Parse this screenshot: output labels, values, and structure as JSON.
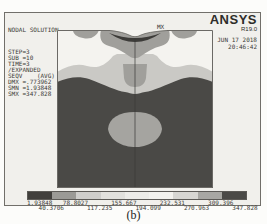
{
  "figure": {
    "brand": {
      "name": "ANSYS",
      "version": "R19.0"
    },
    "timestamp": {
      "date": "JUN 17 2018",
      "time": "20:46:42"
    },
    "solution_info": {
      "title": "NODAL SOLUTION",
      "lines": [
        "STEP=3",
        "SUB =10",
        "TIME=3",
        "/EXPANDED",
        "SEQV    (AVG)",
        "DMX =.773962",
        "SMN =1.93848",
        "SMX =347.828"
      ]
    },
    "plot": {
      "max_label": "MX",
      "colors": {
        "background": "#f4f3ef",
        "light": "#cac9c5",
        "medium": "#a09f9b",
        "tongue": "#a09f9b",
        "dark": "#4a4946",
        "crescent": "#3d3c39",
        "blob": "#a5a4a0",
        "centerline": "#3a3936",
        "border": "#6b6965"
      }
    },
    "colorbar": {
      "values": [
        "1.93848",
        "40.3706",
        "78.8027",
        "117.235",
        "155.667",
        "194.099",
        "232.531",
        "270.963",
        "309.396",
        "347.828"
      ],
      "colors": [
        "#413f3c",
        "#9b9a96",
        "#cfcecb",
        "#e2e1dd",
        "#edece8",
        "#f3f2ee",
        "#d7d6d2",
        "#a8a7a3",
        "#4b4a47"
      ]
    },
    "caption": "(b)"
  },
  "chart_data": {
    "type": "heatmap",
    "title": "NODAL SOLUTION",
    "quantity": "SEQV (AVG)",
    "step": 3,
    "substep": 10,
    "time": 3,
    "expanded": true,
    "dmx": 0.773962,
    "smn": 1.93848,
    "smx": 347.828,
    "contour_levels": [
      1.93848,
      40.3706,
      78.8027,
      117.235,
      155.667,
      194.099,
      232.531,
      270.963,
      309.396,
      347.828
    ],
    "legend_position": "bottom",
    "annotations": [
      "MX marker at top-center contact zone of stress contour"
    ]
  }
}
